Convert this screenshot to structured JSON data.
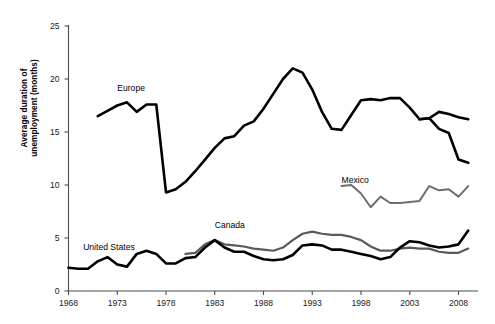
{
  "chart_data": {
    "type": "line",
    "title": "",
    "xlabel": "",
    "ylabel_line1": "Average duration of",
    "ylabel_line2": "unemployment (months)",
    "xlim": [
      1968,
      2010
    ],
    "ylim": [
      0,
      25
    ],
    "yticks": [
      0,
      5,
      10,
      15,
      20,
      25
    ],
    "xticks": [
      1968,
      1973,
      1978,
      1983,
      1988,
      1993,
      1998,
      2003,
      2008
    ],
    "grid": false,
    "legend_position": "inline-annotations",
    "series": [
      {
        "name": "Europe",
        "color": "#000000",
        "width": 2.6,
        "label_x": 1973.0,
        "label_y": 19.1,
        "x": [
          1971,
          1972,
          1973,
          1974,
          1975,
          1976,
          1977,
          1978,
          1979,
          1980,
          1981,
          1982,
          1983,
          1984,
          1985,
          1986,
          1987,
          1988,
          1989,
          1990,
          1991,
          1992,
          1993,
          1994,
          1995,
          1996,
          1997,
          1998,
          1999,
          2000,
          2001,
          2002,
          2003,
          2004,
          2005,
          2006,
          2007,
          2008,
          2009
        ],
        "y": [
          16.5,
          17.0,
          17.5,
          17.8,
          16.9,
          17.6,
          17.6,
          9.3,
          9.6,
          10.3,
          11.3,
          12.4,
          13.5,
          14.4,
          14.6,
          15.6,
          16.0,
          17.2,
          18.6,
          20.0,
          21.0,
          20.6,
          19.0,
          16.9,
          15.3,
          15.2,
          16.6,
          18.0,
          18.1,
          18.0,
          18.2,
          18.2,
          17.3,
          16.2,
          16.3,
          16.9,
          16.7,
          16.4,
          16.2
        ]
      },
      {
        "name": "Europe-tail",
        "color": "#000000",
        "width": 2.6,
        "x": [
          2004,
          2005,
          2006,
          2007,
          2008,
          2009
        ],
        "y": [
          16.2,
          16.3,
          15.3,
          14.9,
          12.4,
          12.1
        ]
      },
      {
        "name": "Mexico",
        "color": "#6e6e6e",
        "width": 2.0,
        "label_x": 1996.0,
        "label_y": 10.4,
        "x": [
          1996,
          1997,
          1998,
          1999,
          2000,
          2001,
          2002,
          2003,
          2004,
          2005,
          2006,
          2007,
          2008,
          2009
        ],
        "y": [
          9.9,
          10.0,
          9.2,
          7.9,
          8.9,
          8.3,
          8.3,
          8.4,
          8.5,
          9.9,
          9.5,
          9.6,
          8.9,
          9.9
        ]
      },
      {
        "name": "Canada",
        "color": "#5a5a5a",
        "width": 2.2,
        "label_x": 1983.0,
        "label_y": 6.1,
        "x": [
          1980,
          1981,
          1982,
          1983,
          1984,
          1985,
          1986,
          1987,
          1988,
          1989,
          1990,
          1991,
          1992,
          1993,
          1994,
          1995,
          1996,
          1997,
          1998,
          1999,
          2000,
          2001,
          2002,
          2003,
          2004,
          2005,
          2006,
          2007,
          2008,
          2009
        ],
        "y": [
          3.5,
          3.6,
          4.4,
          4.8,
          4.4,
          4.3,
          4.2,
          4.0,
          3.9,
          3.8,
          4.1,
          4.8,
          5.4,
          5.6,
          5.4,
          5.3,
          5.3,
          5.1,
          4.8,
          4.2,
          3.8,
          3.8,
          4.0,
          4.1,
          4.0,
          4.0,
          3.7,
          3.6,
          3.6,
          4.0
        ]
      },
      {
        "name": "United States",
        "color": "#000000",
        "width": 2.6,
        "label_x": 1969.5,
        "label_y": 4.1,
        "x": [
          1968,
          1969,
          1970,
          1971,
          1972,
          1973,
          1974,
          1975,
          1976,
          1977,
          1978,
          1979,
          1980,
          1981,
          1982,
          1983,
          1984,
          1985,
          1986,
          1987,
          1988,
          1989,
          1990,
          1991,
          1992,
          1993,
          1994,
          1995,
          1996,
          1997,
          1998,
          1999,
          2000,
          2001,
          2002,
          2003,
          2004,
          2005,
          2006,
          2007,
          2008,
          2009
        ],
        "y": [
          2.2,
          2.1,
          2.1,
          2.8,
          3.2,
          2.5,
          2.3,
          3.5,
          3.8,
          3.5,
          2.6,
          2.6,
          3.1,
          3.2,
          4.1,
          4.8,
          4.1,
          3.7,
          3.7,
          3.3,
          3.0,
          2.9,
          3.0,
          3.4,
          4.3,
          4.4,
          4.3,
          3.9,
          3.9,
          3.7,
          3.5,
          3.3,
          3.0,
          3.2,
          4.1,
          4.7,
          4.6,
          4.3,
          4.1,
          4.2,
          4.4,
          5.7
        ]
      }
    ]
  },
  "axis": {
    "ylabel_line1": "Average duration of",
    "ylabel_line2": "unemployment (months)"
  },
  "ytick_labels": [
    "25",
    "20",
    "15",
    "10",
    "5",
    "0"
  ],
  "xtick_labels": [
    "1968",
    "1973",
    "1978",
    "1983",
    "1988",
    "1993",
    "1998",
    "2003",
    "2008"
  ],
  "annotations": {
    "europe": "Europe",
    "mexico": "Mexico",
    "canada": "Canada",
    "united_states": "United States"
  },
  "colors": {
    "europe": "#000000",
    "mexico": "#6e6e6e",
    "canada": "#5a5a5a",
    "united_states": "#000000",
    "axis": "#4d4d4d"
  }
}
